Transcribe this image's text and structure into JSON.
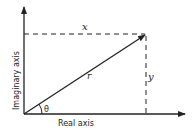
{
  "diagram": {
    "type": "complex-plane-polar",
    "axes": {
      "x_label": "Real axis",
      "y_label": "Imaginary axis"
    },
    "labels": {
      "x_component": "x",
      "y_component": "y",
      "radius": "r",
      "angle": "θ"
    },
    "colors": {
      "line": "#222222",
      "background": "#ffffff"
    }
  }
}
